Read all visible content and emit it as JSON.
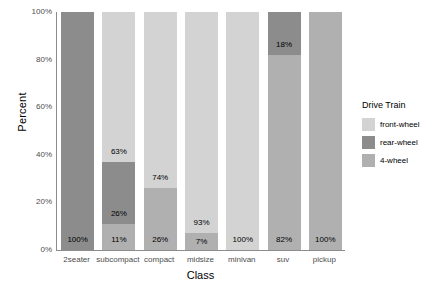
{
  "chart_data": {
    "type": "bar",
    "subtype": "stacked-percent",
    "title": "",
    "xlabel": "Class",
    "ylabel": "Percent",
    "categories": [
      "2seater",
      "subcompact",
      "compact",
      "midsize",
      "minivan",
      "suv",
      "pickup"
    ],
    "ylim": [
      0,
      100
    ],
    "ytick_labels": [
      "0%",
      "20%",
      "40%",
      "60%",
      "80%",
      "100%"
    ],
    "ytick_values": [
      0,
      20,
      40,
      60,
      80,
      100
    ],
    "grid": false,
    "legend_position": "right",
    "legend_title": "Drive Train",
    "series": [
      {
        "name": "front-wheel",
        "color": "#d3d3d3",
        "values": [
          0,
          63,
          74,
          93,
          100,
          0,
          0
        ],
        "labels": [
          "",
          "63%",
          "74%",
          "93%",
          "100%",
          "",
          ""
        ]
      },
      {
        "name": "rear-wheel",
        "color": "#8c8c8c",
        "values": [
          100,
          26,
          0,
          0,
          0,
          18,
          0
        ],
        "labels": [
          "100%",
          "26%",
          "",
          "",
          "",
          "18%",
          ""
        ]
      },
      {
        "name": "4-wheel",
        "color": "#b0b0b0",
        "values": [
          0,
          11,
          26,
          7,
          0,
          82,
          100
        ],
        "labels": [
          "",
          "11%",
          "26%",
          "7%",
          "",
          "82%",
          "100%"
        ]
      }
    ],
    "bars": [
      {
        "category": "2seater",
        "segments": [
          {
            "series": "rear-wheel",
            "value": 100,
            "label": "100%",
            "color": "#8c8c8c"
          }
        ]
      },
      {
        "category": "subcompact",
        "segments": [
          {
            "series": "front-wheel",
            "value": 63,
            "label": "63%",
            "color": "#d3d3d3"
          },
          {
            "series": "rear-wheel",
            "value": 26,
            "label": "26%",
            "color": "#8c8c8c"
          },
          {
            "series": "4-wheel",
            "value": 11,
            "label": "11%",
            "color": "#b0b0b0"
          }
        ]
      },
      {
        "category": "compact",
        "segments": [
          {
            "series": "front-wheel",
            "value": 74,
            "label": "74%",
            "color": "#d3d3d3"
          },
          {
            "series": "4-wheel",
            "value": 26,
            "label": "26%",
            "color": "#b0b0b0"
          }
        ]
      },
      {
        "category": "midsize",
        "segments": [
          {
            "series": "front-wheel",
            "value": 93,
            "label": "93%",
            "color": "#d3d3d3"
          },
          {
            "series": "4-wheel",
            "value": 7,
            "label": "7%",
            "color": "#b0b0b0"
          }
        ]
      },
      {
        "category": "minivan",
        "segments": [
          {
            "series": "front-wheel",
            "value": 100,
            "label": "100%",
            "color": "#d3d3d3"
          }
        ]
      },
      {
        "category": "suv",
        "segments": [
          {
            "series": "rear-wheel",
            "value": 18,
            "label": "18%",
            "color": "#8c8c8c"
          },
          {
            "series": "4-wheel",
            "value": 82,
            "label": "82%",
            "color": "#b0b0b0"
          }
        ]
      },
      {
        "category": "pickup",
        "segments": [
          {
            "series": "4-wheel",
            "value": 100,
            "label": "100%",
            "color": "#b0b0b0"
          }
        ]
      }
    ],
    "legend_entries": [
      {
        "label": "front-wheel",
        "color": "#d3d3d3"
      },
      {
        "label": "rear-wheel",
        "color": "#8c8c8c"
      },
      {
        "label": "4-wheel",
        "color": "#b0b0b0"
      }
    ]
  }
}
